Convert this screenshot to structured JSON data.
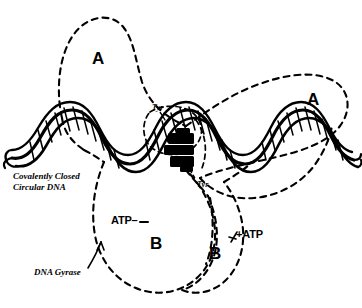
{
  "figure": {
    "kind": "dna-gyrase-schematic",
    "background_color": "#ffffff",
    "ink_color": "#000000",
    "width": 362,
    "height": 308
  },
  "labels": {
    "subunit_a_left": "A",
    "subunit_a_right": "A",
    "subunit_b_left": "B",
    "subunit_b_right": "B",
    "atp_left": "ATP–",
    "atp_right": "+ATP",
    "tyr_upper": "Tyr",
    "tyr_lower": "Tyr",
    "dna_caption_line1": "Covalently Closed",
    "dna_caption_line2": "Circular DNA",
    "gyrase_caption": "DNA Gyrase"
  },
  "icons": {
    "dna_helix": "dna-double-helix-icon",
    "catalytic_core": "black-catalytic-core-icon",
    "pointer_gyrase": "arrow-pointer-icon",
    "pointer_tyr": "tyr-leader-line-icon",
    "lobe_outline": "dashed-lobe-outline-icon"
  }
}
